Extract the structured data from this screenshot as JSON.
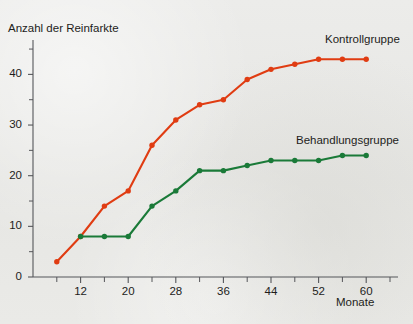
{
  "chart_data": {
    "type": "line",
    "title": "",
    "subtitle": "",
    "ylabel": "Anzahl der Reinfarkte",
    "xlabel": "Monate",
    "xlim": [
      4,
      64
    ],
    "ylim": [
      0,
      46
    ],
    "grid": false,
    "legend_position": "inline-right-of-series",
    "x_ticks_major": [
      12,
      20,
      28,
      36,
      44,
      52,
      60
    ],
    "x_tick_labels": [
      "12",
      "20",
      "28",
      "36",
      "44",
      "52",
      "60"
    ],
    "x_ticks_minor": [
      8,
      16,
      24,
      32,
      40,
      48,
      56,
      64
    ],
    "y_ticks_major": [
      0,
      10,
      20,
      30,
      40
    ],
    "y_tick_labels": [
      "0",
      "10",
      "20",
      "30",
      "40"
    ],
    "y_ticks_minor": [
      5,
      15,
      25,
      35,
      45
    ],
    "series": [
      {
        "name": "Kontrollgruppe",
        "color": "#e03c12",
        "x": [
          8,
          12,
          16,
          20,
          24,
          28,
          32,
          36,
          40,
          44,
          48,
          52,
          56,
          60
        ],
        "values": [
          3,
          8,
          14,
          17,
          26,
          31,
          34,
          35,
          39,
          41,
          42,
          43,
          43,
          43
        ]
      },
      {
        "name": "Behandlungsgruppe",
        "color": "#1a7a38",
        "x": [
          12,
          16,
          20,
          24,
          28,
          32,
          36,
          40,
          44,
          48,
          52,
          56,
          60
        ],
        "values": [
          8,
          8,
          8,
          14,
          17,
          21,
          21,
          22,
          23,
          23,
          23,
          24,
          24
        ]
      }
    ]
  },
  "axes": {
    "y_axis_title": "Anzahl der Reinfarkte",
    "x_axis_title": "Monate"
  },
  "legend": {
    "control_label": "Kontrollgruppe",
    "treatment_label": "Behandlungsgruppe"
  },
  "colors": {
    "control": "#e03c12",
    "treatment": "#1a7a38",
    "axis": "#55565a",
    "text": "#1d1d1b",
    "background": "#e9e9e6"
  }
}
